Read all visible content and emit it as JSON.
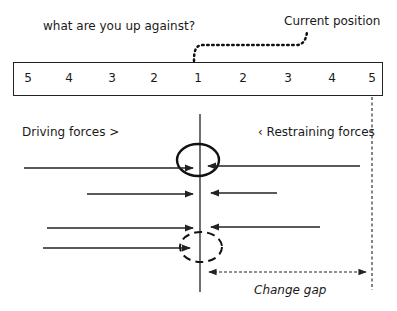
{
  "title": "what are you up against?",
  "annotation_current": "Current position",
  "scale": {
    "labels": [
      "5",
      "4",
      "3",
      "2",
      "1",
      "2",
      "3",
      "4",
      "5"
    ]
  },
  "driving_label": "Driving forces >",
  "restraining_label": "‹ Restraining forces",
  "change_gap_label": "Change gap",
  "forces": {
    "driving": [
      {
        "x1": 24,
        "y": 168
      },
      {
        "x1": 87,
        "y": 194
      },
      {
        "x1": 47,
        "y": 228
      },
      {
        "x1": 43,
        "y": 248
      }
    ],
    "restraining": [
      {
        "x1": 360,
        "y": 166
      },
      {
        "x1": 277,
        "y": 193
      },
      {
        "x1": 320,
        "y": 227
      }
    ]
  }
}
